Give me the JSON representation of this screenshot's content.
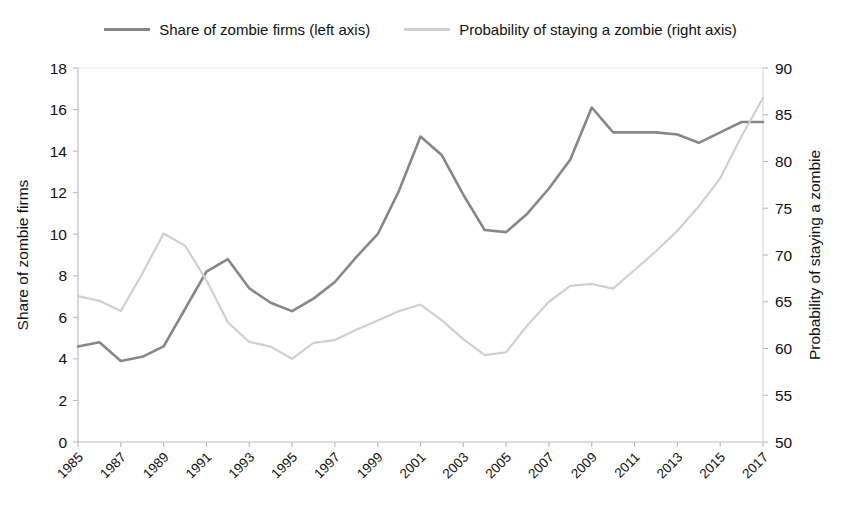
{
  "legend": {
    "position": "top-center",
    "entries": [
      {
        "label": "Share of zombie firms (left axis)",
        "color": "#86868e",
        "swatch_name": "legend-swatch-share"
      },
      {
        "label": "Probability of staying a zombie (right axis)",
        "color": "#cfcfd4",
        "swatch_name": "legend-swatch-probability"
      }
    ]
  },
  "chart_data": {
    "type": "line",
    "title": "",
    "xlabel": "",
    "ylabel": "Share of zombie firms",
    "y2label": "Probability of staying a zombie",
    "grid": false,
    "legend_position": "top-center",
    "x": [
      1985,
      1986,
      1987,
      1988,
      1989,
      1990,
      1991,
      1992,
      1993,
      1994,
      1995,
      1996,
      1997,
      1998,
      1999,
      2000,
      2001,
      2002,
      2003,
      2004,
      2005,
      2006,
      2007,
      2008,
      2009,
      2010,
      2011,
      2012,
      2013,
      2014,
      2015,
      2016,
      2017
    ],
    "xtick_labels": [
      "1985",
      "1987",
      "1989",
      "1991",
      "1993",
      "1995",
      "1997",
      "1999",
      "2001",
      "2003",
      "2005",
      "2007",
      "2009",
      "2011",
      "2013",
      "2015",
      "2017"
    ],
    "xtick_values": [
      1985,
      1987,
      1989,
      1991,
      1993,
      1995,
      1997,
      1999,
      2001,
      2003,
      2005,
      2007,
      2009,
      2011,
      2013,
      2015,
      2017
    ],
    "xlim": [
      1985,
      2017
    ],
    "ylim": [
      0,
      18
    ],
    "ytick_values": [
      0,
      2,
      4,
      6,
      8,
      10,
      12,
      14,
      16,
      18
    ],
    "ytick_labels": [
      "0",
      "2",
      "4",
      "6",
      "8",
      "10",
      "12",
      "14",
      "16",
      "18"
    ],
    "y2lim": [
      50,
      90
    ],
    "y2tick_values": [
      50,
      55,
      60,
      65,
      70,
      75,
      80,
      85,
      90
    ],
    "y2tick_labels": [
      "50",
      "55",
      "60",
      "65",
      "70",
      "75",
      "80",
      "85",
      "90"
    ],
    "series": [
      {
        "name": "Share of zombie firms (left axis)",
        "axis": "left",
        "color": "#86868e",
        "width": 2.6,
        "values": [
          4.6,
          4.8,
          3.9,
          4.1,
          4.6,
          6.4,
          8.2,
          8.8,
          7.4,
          6.7,
          6.3,
          6.9,
          7.7,
          8.9,
          10.0,
          12.1,
          14.7,
          13.8,
          11.9,
          10.2,
          10.1,
          11.0,
          12.2,
          13.6,
          16.1,
          14.9,
          14.9,
          14.9,
          14.8,
          14.4,
          14.9,
          15.4,
          15.4
        ]
      },
      {
        "name": "Probability of staying a zombie (right axis)",
        "axis": "right",
        "color": "#cfcfd4",
        "width": 2.2,
        "values": [
          65.6,
          65.1,
          64.0,
          68.0,
          72.3,
          71.0,
          67.3,
          62.8,
          60.7,
          60.2,
          58.9,
          60.6,
          60.9,
          62.0,
          63.0,
          64.0,
          64.7,
          63.0,
          61.0,
          59.3,
          59.6,
          62.5,
          65.0,
          66.7,
          66.9,
          66.4,
          68.4,
          70.4,
          72.6,
          75.2,
          78.2,
          82.7,
          86.8
        ]
      }
    ]
  }
}
